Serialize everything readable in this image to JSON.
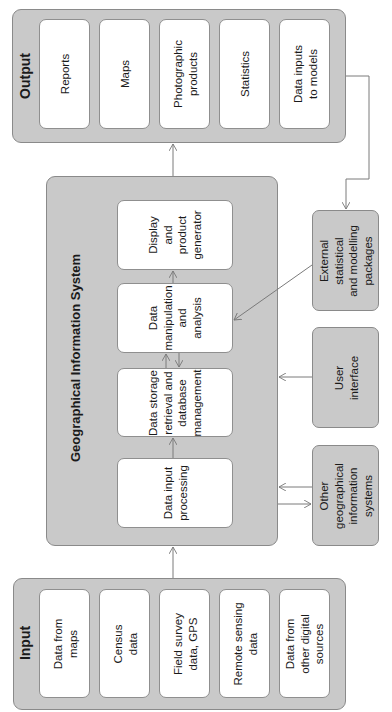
{
  "diagram": {
    "orientation": "rotated -90deg (read bottom-to-top)",
    "colors": {
      "group_fill": "#c9c9c9",
      "box_fill": "#ffffff",
      "border": "#8a8a8a",
      "line": "#7a7a7a"
    }
  },
  "output": {
    "title": "Output",
    "items": [
      {
        "label": "Reports"
      },
      {
        "label": "Maps"
      },
      {
        "label": "Photographic\nproducts"
      },
      {
        "label": "Statistics"
      },
      {
        "label": "Data inputs\nto models"
      }
    ]
  },
  "gis": {
    "title": "Geographical Information System",
    "modules": [
      {
        "label": "Display\nand\nproduct\ngenerator"
      },
      {
        "label": "Data\nmanipulation\nand\nanalysis"
      },
      {
        "label": "Data storage\nretrieval and\ndatabase\nmanagement"
      },
      {
        "label": "Data input\nprocessing"
      }
    ]
  },
  "external": {
    "items": [
      {
        "label": "External\nstatistical\nand modelling\npackages"
      },
      {
        "label": "User\ninterface"
      },
      {
        "label": "Other\ngeographical\ninformation\nsystems"
      }
    ]
  },
  "input": {
    "title": "Input",
    "items": [
      {
        "label": "Data from\nmaps"
      },
      {
        "label": "Census\ndata"
      },
      {
        "label": "Field survey\ndata, GPS"
      },
      {
        "label": "Remote sensing\ndata"
      },
      {
        "label": "Data from\nother digital\nsources"
      }
    ]
  },
  "connections": [
    {
      "from": "Input",
      "to": "Geographical Information System"
    },
    {
      "from": "Data input processing",
      "to": "Data storage retrieval and database management"
    },
    {
      "from": "Data storage retrieval and database management",
      "to": "Data manipulation and analysis",
      "bidirectional": true
    },
    {
      "from": "Data manipulation and analysis",
      "to": "Display and product generator"
    },
    {
      "from": "Geographical Information System",
      "to": "Output"
    },
    {
      "from": "Output (Data inputs to models)",
      "to": "External statistical and modelling packages"
    },
    {
      "from": "External statistical and modelling packages",
      "to": "Data manipulation and analysis"
    },
    {
      "from": "User interface",
      "to": "Geographical Information System"
    },
    {
      "from": "Other geographical information systems",
      "to": "Geographical Information System",
      "bidirectional": true
    }
  ]
}
